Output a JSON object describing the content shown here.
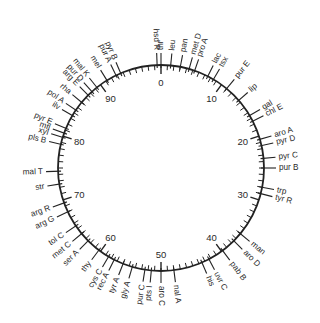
{
  "diagram": {
    "type": "circular-genetic-map",
    "scale": {
      "min": 0,
      "max": 100,
      "unit": "minutes",
      "major_ticks": [
        0,
        10,
        20,
        30,
        40,
        50,
        60,
        70,
        80,
        90
      ]
    },
    "colors": {
      "line": "#222222",
      "text": "#2a2a2a",
      "background": "#ffffff"
    },
    "genes": [
      {
        "label": "thr",
        "pos": 0.0
      },
      {
        "label": "hsd R",
        "pos": 99.4
      },
      {
        "label": "leu",
        "pos": 1.5
      },
      {
        "label": "pan",
        "pos": 3.0
      },
      {
        "label": "met D",
        "pos": 4.4
      },
      {
        "label": "pro A",
        "pos": 5.3
      },
      {
        "label": "lac",
        "pos": 7.5
      },
      {
        "label": "tsx",
        "pos": 8.5
      },
      {
        "label": "pur E",
        "pos": 11.0
      },
      {
        "label": "lip",
        "pos": 13.6
      },
      {
        "label": "gal",
        "pos": 16.5
      },
      {
        "label": "chl E",
        "pos": 17.5
      },
      {
        "label": "aro A",
        "pos": 20.5
      },
      {
        "label": "pyr D",
        "pos": 21.5
      },
      {
        "label": "pyr C",
        "pos": 23.5
      },
      {
        "label": "pur B",
        "pos": 25.0
      },
      {
        "label": "trp",
        "pos": 28.0
      },
      {
        "label": "tyr R",
        "pos": 29.0
      },
      {
        "label": "man",
        "pos": 36.0
      },
      {
        "label": "aro D",
        "pos": 37.5
      },
      {
        "label": "pab B",
        "pos": 39.8
      },
      {
        "label": "uvr C",
        "pos": 42.3
      },
      {
        "label": "his",
        "pos": 43.5
      },
      {
        "label": "nal A",
        "pos": 48.0
      },
      {
        "label": "aro C",
        "pos": 50.0
      },
      {
        "label": "pts I",
        "pos": 51.5
      },
      {
        "label": "pur C",
        "pos": 52.5
      },
      {
        "label": "gly A",
        "pos": 54.5
      },
      {
        "label": "tyr A",
        "pos": 56.0
      },
      {
        "label": "rec A",
        "pos": 57.5
      },
      {
        "label": "cys C",
        "pos": 58.5
      },
      {
        "label": "thy",
        "pos": 60.3
      },
      {
        "label": "ser A",
        "pos": 62.5
      },
      {
        "label": "met C",
        "pos": 64.0
      },
      {
        "label": "tol C",
        "pos": 65.5
      },
      {
        "label": "arg G",
        "pos": 68.0
      },
      {
        "label": "arg R",
        "pos": 69.5
      },
      {
        "label": "str",
        "pos": 72.5
      },
      {
        "label": "mal T",
        "pos": 74.5
      },
      {
        "label": "pls B",
        "pos": 78.7
      },
      {
        "label": "xyl",
        "pos": 79.8
      },
      {
        "label": "mtl",
        "pos": 80.5
      },
      {
        "label": "pyr E",
        "pos": 81.3
      },
      {
        "label": "ilv",
        "pos": 83.5
      },
      {
        "label": "pol A",
        "pos": 84.5
      },
      {
        "label": "rha",
        "pos": 86.0
      },
      {
        "label": "arg E",
        "pos": 87.5
      },
      {
        "label": "pur D",
        "pos": 88.3
      },
      {
        "label": "mal K",
        "pos": 89.3
      },
      {
        "label": "mel",
        "pos": 91.2
      },
      {
        "label": "pur A",
        "pos": 92.8
      },
      {
        "label": "pyr B",
        "pos": 93.6
      }
    ]
  }
}
